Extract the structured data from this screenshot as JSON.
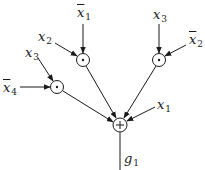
{
  "diagram": {
    "title": "",
    "colors": {
      "stroke": "#1a1a1a",
      "background": "#ffffff"
    },
    "nodes": [
      {
        "id": "and_a",
        "op": "·",
        "type": "AND",
        "cx": 83,
        "cy": 60
      },
      {
        "id": "and_b",
        "op": "·",
        "type": "AND",
        "cx": 159,
        "cy": 60
      },
      {
        "id": "and_c",
        "op": "·",
        "type": "AND",
        "cx": 57,
        "cy": 87
      },
      {
        "id": "or_g",
        "op": "+",
        "type": "OR",
        "cx": 120,
        "cy": 125
      }
    ],
    "inputs": [
      {
        "id": "in_x1bar_a",
        "var": "x",
        "sub": "1",
        "negated": true,
        "target": "and_a"
      },
      {
        "id": "in_x2_a",
        "var": "x",
        "sub": "2",
        "negated": false,
        "target": "and_a"
      },
      {
        "id": "in_x3_b",
        "var": "x",
        "sub": "3",
        "negated": false,
        "target": "and_b"
      },
      {
        "id": "in_x2bar_b",
        "var": "x",
        "sub": "2",
        "negated": true,
        "target": "and_b"
      },
      {
        "id": "in_x3_c",
        "var": "x",
        "sub": "3",
        "negated": false,
        "target": "and_c"
      },
      {
        "id": "in_x4bar_c",
        "var": "x",
        "sub": "4",
        "negated": true,
        "target": "and_c"
      },
      {
        "id": "in_x1_or",
        "var": "x",
        "sub": "1",
        "negated": false,
        "target": "or_g"
      }
    ],
    "output": {
      "var": "g",
      "sub": "1",
      "source": "or_g"
    },
    "edges": [
      {
        "from": "and_a",
        "to": "or_g"
      },
      {
        "from": "and_b",
        "to": "or_g"
      },
      {
        "from": "and_c",
        "to": "or_g"
      }
    ]
  }
}
